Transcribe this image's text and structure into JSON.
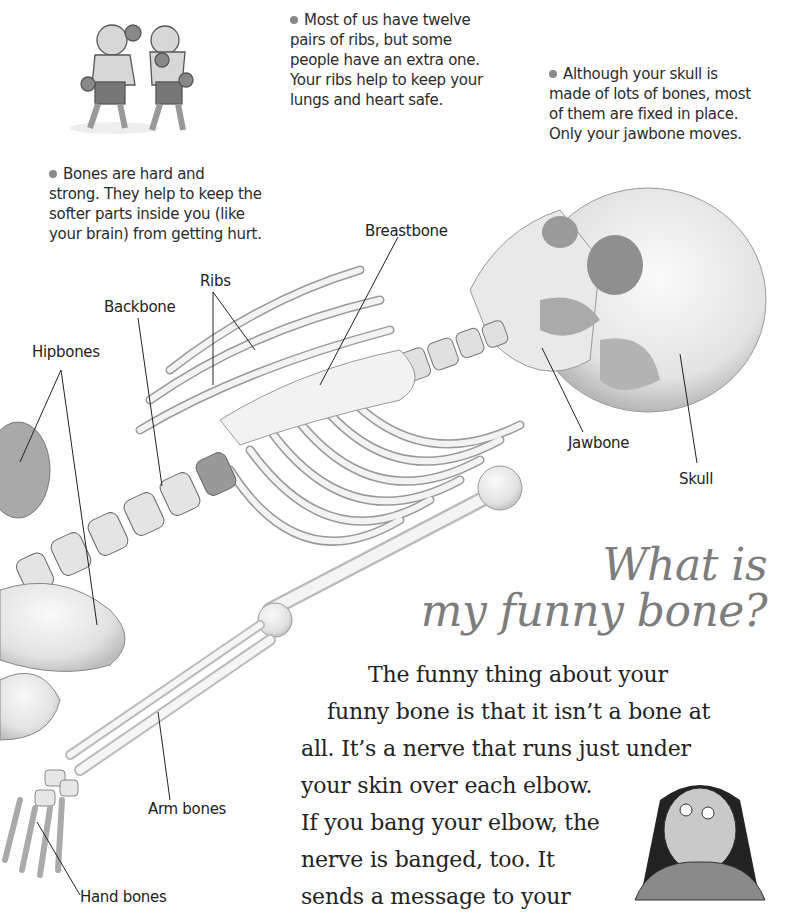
{
  "facts": [
    {
      "id": "ribs",
      "lines": [
        "Most of us have twelve",
        "pairs of ribs, but some",
        "people have an extra one.",
        "Your ribs help to keep your",
        "lungs and heart safe."
      ]
    },
    {
      "id": "skull",
      "lines": [
        "Although your skull is",
        "made of lots of bones, most",
        "of them are fixed in place.",
        "Only your jawbone moves."
      ]
    },
    {
      "id": "bones",
      "lines": [
        "Bones are hard and",
        "strong. They help to keep the",
        "softer parts inside you (like",
        "your brain) from getting hurt."
      ]
    }
  ],
  "labels": {
    "breastbone": "Breastbone",
    "ribs": "Ribs",
    "backbone": "Backbone",
    "hipbones": "Hipbones",
    "jawbone": "Jawbone",
    "skull": "Skull",
    "arm_bones": "Arm bones",
    "hand_bones": "Hand bones"
  },
  "heading": {
    "line1": "What is",
    "line2": "my funny bone?"
  },
  "body": {
    "lines": [
      "The funny thing about your",
      "funny bone is that it isn’t a bone at",
      "all. It’s a nerve that runs just under",
      "your skin over each elbow.",
      "If you bang your elbow, the",
      "nerve is banged, too. It",
      "sends a message to your"
    ]
  },
  "illustrations": {
    "boxers": "boxing-boys-illustration",
    "skeleton": "skeleton-illustration",
    "girl": "surprised-girl-illustration"
  },
  "colors": {
    "heading": "#7d7d7d",
    "text": "#222222",
    "bullet": "#8a8a8a",
    "bone": "#efefef",
    "bone_shade": "#c9c9c9"
  }
}
